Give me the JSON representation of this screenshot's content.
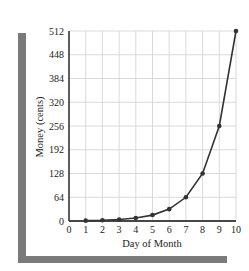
{
  "chart_data": {
    "type": "line",
    "title": "",
    "xlabel": "Day of Month",
    "ylabel": "Money (cents)",
    "x": [
      1,
      2,
      3,
      4,
      5,
      6,
      7,
      8,
      9,
      10
    ],
    "series": [
      {
        "name": "Money",
        "values": [
          1,
          2,
          4,
          8,
          16,
          32,
          64,
          128,
          256,
          512
        ]
      }
    ],
    "xlim": [
      0,
      10
    ],
    "ylim": [
      0,
      512
    ],
    "xticks": [
      "0",
      "1",
      "2",
      "3",
      "4",
      "5",
      "6",
      "7",
      "8",
      "9",
      "10"
    ],
    "yticks": [
      "0",
      "64",
      "128",
      "192",
      "256",
      "320",
      "384",
      "448",
      "512"
    ],
    "grid": true,
    "legend": "none"
  },
  "colors": {
    "line": "#333333",
    "grid": "#d9d9d9",
    "axis": "#111111",
    "frame": "#7a7a7a"
  }
}
